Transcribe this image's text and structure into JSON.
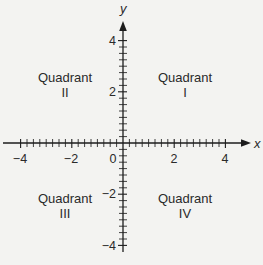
{
  "diagram": {
    "title": "",
    "type": "coordinate-plane",
    "x_axis": {
      "label": "x",
      "range": [
        -4,
        4
      ],
      "major_ticks": [
        -4,
        -2,
        0,
        2,
        4
      ],
      "tick_labels": [
        "−4",
        "−2",
        "0",
        "2",
        "4"
      ],
      "minor_step": 0.25
    },
    "y_axis": {
      "label": "y",
      "range": [
        -4,
        4
      ],
      "major_ticks": [
        4,
        2,
        -2,
        -4
      ],
      "tick_labels": [
        "4",
        "2",
        "−2",
        "−4"
      ],
      "minor_step": 0.25
    },
    "quadrants": [
      {
        "id": "I",
        "line1": "Quadrant",
        "line2": "I",
        "position": "top-right"
      },
      {
        "id": "II",
        "line1": "Quadrant",
        "line2": "II",
        "position": "top-left"
      },
      {
        "id": "III",
        "line1": "Quadrant",
        "line2": "III",
        "position": "bottom-left"
      },
      {
        "id": "IV",
        "line1": "Quadrant",
        "line2": "IV",
        "position": "bottom-right"
      }
    ],
    "colors": {
      "background": "#f3f3f1",
      "ink": "#1c1c1c"
    }
  }
}
